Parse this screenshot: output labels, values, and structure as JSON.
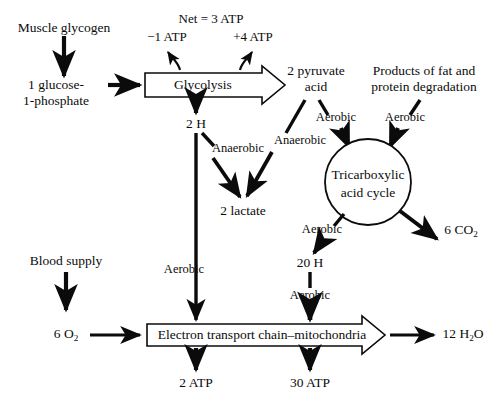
{
  "diagram": {
    "ink_color": "#0b0b0b",
    "background": "#ffffff"
  },
  "nodes": {
    "muscle_glycogen": "Muscle glycogen",
    "glucose_1_phosphate_line1": "1 glucose-",
    "glucose_1_phosphate_line2": "1-phosphate",
    "glycolysis": "Glycolysis",
    "two_h": "2 H",
    "two_lactate": "2 lactate",
    "pyruvate_line1": "2 pyruvate",
    "pyruvate_line2": "acid",
    "fat_protein_line1": "Products of fat and",
    "fat_protein_line2": "protein degradation",
    "tca_line1": "Tricarboxylic",
    "tca_line2": "acid cycle",
    "co2": "6 CO",
    "co2_sub": "2",
    "twenty_h": "20 H",
    "blood_supply": "Blood supply",
    "o2": "6 O",
    "o2_sub": "2",
    "etc": "Electron transport chain–mitochondria",
    "h2o": "12 H",
    "h2o_sub": "2",
    "h2o_tail": "O",
    "atp_2": "2 ATP",
    "atp_30": "30 ATP"
  },
  "atp_balance": {
    "net": "Net = 3 ATP",
    "cost": "−1 ATP",
    "gain": "+4 ATP"
  },
  "conditions": {
    "anaerobic_from_2h": "Anaerobic",
    "anaerobic_from_pyruvate": "Anaerobic",
    "aerobic_2h_to_etc": "Aerobic",
    "aerobic_pyruvate_to_tca": "Aerobic",
    "aerobic_fat_to_tca": "Aerobic",
    "aerobic_tca_to_20h": "Aerobic",
    "aerobic_20h_to_etc": "Aerobic"
  }
}
